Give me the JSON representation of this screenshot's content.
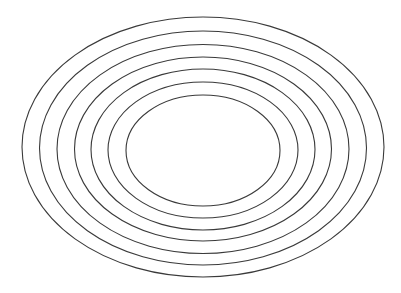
{
  "diagram": {
    "type": "concentric-ellipses",
    "background": "#ffffff",
    "stroke_color": "#3a3a3a",
    "stroke_width": 1.1,
    "ellipses": [
      {
        "cx": 203,
        "cy": 147,
        "rx": 181,
        "ry": 130
      },
      {
        "cx": 203,
        "cy": 148,
        "rx": 163.5,
        "ry": 117
      },
      {
        "cx": 203,
        "cy": 149,
        "rx": 146,
        "ry": 104.5
      },
      {
        "cx": 203,
        "cy": 149,
        "rx": 128.5,
        "ry": 92
      },
      {
        "cx": 203,
        "cy": 149.5,
        "rx": 112,
        "ry": 80.5
      },
      {
        "cx": 203,
        "cy": 150,
        "rx": 95,
        "ry": 68
      },
      {
        "cx": 203,
        "cy": 150.5,
        "rx": 77,
        "ry": 55.5
      }
    ]
  }
}
